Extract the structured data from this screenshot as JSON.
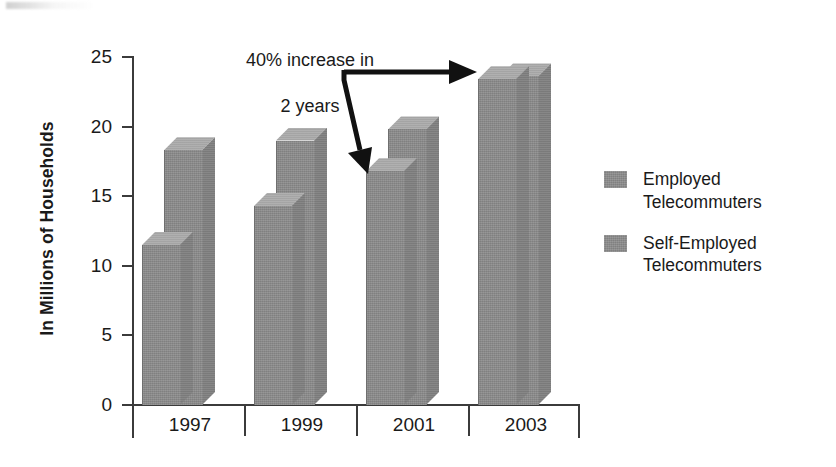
{
  "chart_data": {
    "type": "bar",
    "title": "",
    "subtitle": "",
    "xlabel": "",
    "ylabel": "In Millions of Households",
    "ylim": [
      0,
      25
    ],
    "yticks": [
      0,
      5,
      10,
      15,
      20,
      25
    ],
    "ytick_labels": [
      "0",
      "5",
      "10",
      "15",
      "20",
      "25"
    ],
    "categories": [
      "1997",
      "1999",
      "2001",
      "2003"
    ],
    "grid": false,
    "legend_position": "right",
    "style": "3d-clustered-bar",
    "series": [
      {
        "name": "Employed Telecommuters",
        "values": [
          11.5,
          14.3,
          16.8,
          23.4
        ]
      },
      {
        "name": "Self-Employed Telecommuters",
        "values": [
          18.3,
          19.0,
          19.8,
          23.6
        ]
      }
    ],
    "annotations": [
      {
        "text": "40% increase in\n2 years",
        "arrow": "double-headed, from label right to 2003 bar group and down-left to 2001 employed bar"
      }
    ]
  },
  "axes": {
    "y_title": "In Millions of Households",
    "y_ticks": [
      {
        "label": "25",
        "value": 25
      },
      {
        "label": "20",
        "value": 20
      },
      {
        "label": "15",
        "value": 15
      },
      {
        "label": "10",
        "value": 10
      },
      {
        "label": "5",
        "value": 5
      },
      {
        "label": "0",
        "value": 0
      }
    ],
    "x_ticks": [
      {
        "label": "1997"
      },
      {
        "label": "1999"
      },
      {
        "label": "2001"
      },
      {
        "label": "2003"
      }
    ]
  },
  "annotation": {
    "line1": "40% increase in",
    "line2": "2 years"
  },
  "legend": {
    "items": [
      {
        "label": "Employed\nTelecommuters",
        "color": "#8c8c8c"
      },
      {
        "label": "Self-Employed\nTelecommuters",
        "color": "#8c8c8c"
      }
    ]
  },
  "colors": {
    "bar_front": "#8c8c8c",
    "bar_top": "#ababab",
    "bar_side": "#818181",
    "axis": "#3b3b3b",
    "text": "#1a1a1a",
    "background": "#ffffff"
  }
}
